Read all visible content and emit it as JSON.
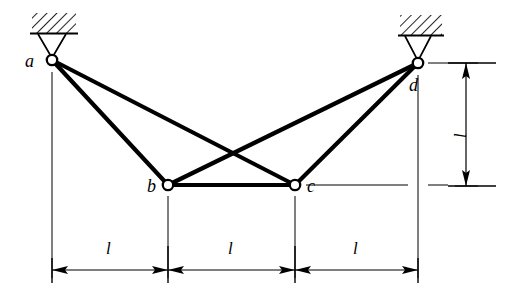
{
  "figure": {
    "type": "truss-diagram",
    "background": "#ffffff",
    "ink": "#000000",
    "nodes": [
      {
        "id": "a",
        "label": "a",
        "x": 52,
        "y": 60,
        "support": "pin-hatched",
        "label_pos": "left"
      },
      {
        "id": "b",
        "label": "b",
        "x": 168,
        "y": 185,
        "support": "none",
        "label_pos": "left"
      },
      {
        "id": "c",
        "label": "c",
        "x": 295,
        "y": 185,
        "support": "none",
        "label_pos": "right"
      },
      {
        "id": "d",
        "label": "d",
        "x": 418,
        "y": 63,
        "support": "pin-hatched",
        "label_pos": "below-right"
      }
    ],
    "members": [
      {
        "from": "a",
        "to": "b"
      },
      {
        "from": "a",
        "to": "c"
      },
      {
        "from": "d",
        "to": "b"
      },
      {
        "from": "d",
        "to": "c"
      },
      {
        "from": "b",
        "to": "c"
      }
    ],
    "horizontal_dimensions": [
      {
        "label": "l",
        "from_x": 52,
        "to_x": 168,
        "y": 270
      },
      {
        "label": "l",
        "from_x": 168,
        "to_x": 295,
        "y": 270
      },
      {
        "label": "l",
        "from_x": 295,
        "to_x": 418,
        "y": 270
      }
    ],
    "vertical_dimensions": [
      {
        "label": "l",
        "x": 466,
        "from_y": 63,
        "to_y": 186
      }
    ]
  }
}
